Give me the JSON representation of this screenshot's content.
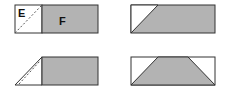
{
  "diagram": {
    "title": "",
    "colors": {
      "fill": "#b3b3b3",
      "stroke": "#333333",
      "background": "#ffffff",
      "dashed": "#666666"
    },
    "panels": [
      {
        "id": "panel-1",
        "labels": {
          "left": "E",
          "right": "F"
        },
        "description": "Rectangle with white square E containing dashed diagonal, gray rectangle F"
      },
      {
        "id": "panel-2",
        "description": "Rectangle with white triangle top-left, remaining gray"
      },
      {
        "id": "panel-3",
        "description": "Folded triangle with dashed line attached to gray rectangle"
      },
      {
        "id": "panel-4",
        "description": "Rectangle with gray trapezoid and white triangles at top corners"
      }
    ]
  }
}
